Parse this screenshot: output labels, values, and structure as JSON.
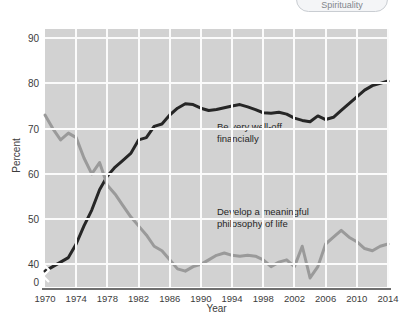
{
  "top_pill": {
    "label": "Spirituality",
    "icon": "pill-tag"
  },
  "chart_data": {
    "type": "line",
    "title": "",
    "xlabel": "Year",
    "ylabel": "Percent",
    "xlim": [
      1970,
      2014
    ],
    "ylim": [
      35,
      92
    ],
    "grid": true,
    "legend_position": "inline-annotation",
    "y_ticks": [
      "90",
      "80",
      "70",
      "60",
      "50",
      "40",
      "0"
    ],
    "y_tick_values": [
      90,
      80,
      70,
      60,
      50,
      40,
      36
    ],
    "axis_break": true,
    "x_ticks": [
      "1970",
      "1974",
      "1978",
      "1982",
      "1986",
      "1990",
      "1994",
      "1998",
      "2002",
      "2006",
      "2010",
      "2014"
    ],
    "x_tick_values": [
      1970,
      1974,
      1978,
      1982,
      1986,
      1990,
      1994,
      1998,
      2002,
      2006,
      2010,
      2014
    ],
    "x": [
      1970,
      1971,
      1972,
      1973,
      1974,
      1975,
      1976,
      1977,
      1978,
      1979,
      1980,
      1981,
      1982,
      1983,
      1984,
      1985,
      1986,
      1987,
      1988,
      1989,
      1990,
      1991,
      1992,
      1993,
      1994,
      1995,
      1996,
      1997,
      1998,
      1999,
      2000,
      2001,
      2002,
      2003,
      2004,
      2005,
      2006,
      2007,
      2008,
      2009,
      2010,
      2011,
      2012,
      2013,
      2014
    ],
    "series": [
      {
        "name": "Be very well-off financially",
        "color": "#262626",
        "annotation": "Be very well-off\nfinancially",
        "annotation_line1": "Be very well-off",
        "annotation_line2": "financially",
        "values": [
          38.5,
          39.5,
          40.5,
          41.5,
          44.5,
          48.5,
          52.0,
          56.5,
          59.5,
          61.5,
          63.0,
          64.5,
          67.5,
          68.0,
          70.5,
          71.0,
          73.0,
          74.5,
          75.5,
          75.3,
          74.5,
          74.0,
          74.2,
          74.6,
          75.0,
          75.3,
          74.8,
          74.2,
          73.5,
          73.4,
          73.6,
          73.2,
          72.3,
          71.8,
          71.5,
          72.8,
          72.0,
          72.5,
          74.0,
          75.5,
          77.0,
          78.5,
          79.5,
          80.0,
          80.5
        ]
      },
      {
        "name": "Develop a meaningful philosophy of life",
        "color": "#9a9a9a",
        "annotation": "Develop a meaningful\nphilosophy of life",
        "annotation_line1": "Develop a meaningful",
        "annotation_line2": "philosophy of life",
        "values": [
          73.0,
          70.0,
          67.5,
          69.0,
          68.0,
          63.5,
          60.0,
          62.5,
          57.5,
          55.5,
          53.0,
          50.5,
          48.5,
          46.5,
          44.0,
          43.0,
          41.0,
          39.0,
          38.5,
          39.5,
          40.0,
          41.0,
          42.0,
          42.5,
          42.0,
          41.8,
          42.0,
          41.8,
          41.0,
          39.5,
          40.5,
          41.0,
          39.5,
          44.0,
          37.0,
          39.5,
          44.5,
          46.0,
          47.5,
          46.0,
          45.0,
          43.5,
          43.0,
          44.0,
          44.5
        ]
      }
    ]
  }
}
